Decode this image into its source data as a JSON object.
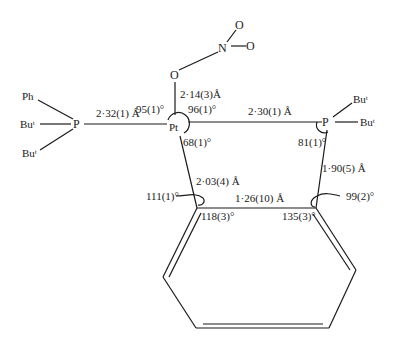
{
  "atoms": {
    "pt": "Pt",
    "p_left": "P",
    "p_right": "P",
    "o_nitrate": "O",
    "n_nitrate": "N",
    "o_top": "O",
    "o_right": "O",
    "ph": "Ph",
    "bu_left_mid": "Buᵗ",
    "bu_left_bottom": "Buᵗ",
    "bu_right_top": "Buᵗ",
    "bu_right_mid": "Buᵗ"
  },
  "bond_lengths": {
    "pt_p_left": "2·32(1) Å",
    "pt_o": "2·14(3)Å",
    "pt_p_right": "2·30(1) Å",
    "pt_c": "2·03(4) Å",
    "c_c": "1·26(10) Å",
    "p_c": "1·90(5) Å"
  },
  "angles": {
    "p_pt_o": "95(1)°",
    "o_pt_p": "96(1)°",
    "at_pt": "68(1)°",
    "at_p_right": "81(1)°",
    "c1_left": "111(1)°",
    "c1_ring": "118(3)°",
    "c2_ring": "135(3)°",
    "c2_right": "99(2)°"
  }
}
